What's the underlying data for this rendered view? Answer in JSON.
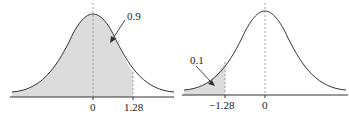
{
  "left_figure": {
    "area_label": "0.9",
    "tick_labels": [
      "0",
      "1.28"
    ],
    "shaded": "left of 1.28"
  },
  "right_figure": {
    "area_label": "0.1",
    "tick_labels": [
      "−1.28",
      "0"
    ],
    "shaded": "left of -1.28"
  },
  "colors": {
    "shade": "#dcdcdc",
    "line": "#333333"
  }
}
